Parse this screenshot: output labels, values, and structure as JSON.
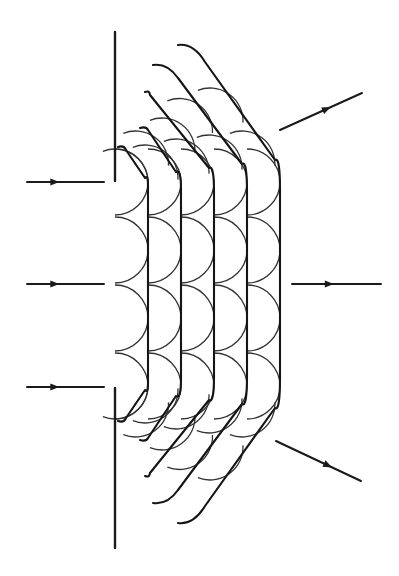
{
  "figure": {
    "title": "Huygens wavelet construction of diffraction through an aperture",
    "colors": {
      "background": "#ffffff",
      "ink": "#1a1a1a"
    }
  },
  "barrier": {
    "x": 115,
    "segments": [
      {
        "name": "upper-barrier",
        "y1": 32,
        "y2": 181
      },
      {
        "name": "lower-barrier",
        "y1": 388,
        "y2": 548
      }
    ]
  },
  "incident_rays": [
    {
      "x1": 27,
      "y1": 182,
      "x2": 104,
      "y2": 182,
      "head_at": 0.42
    },
    {
      "x1": 27,
      "y1": 284,
      "x2": 104,
      "y2": 284,
      "head_at": 0.42
    },
    {
      "x1": 27,
      "y1": 387,
      "x2": 104,
      "y2": 387,
      "head_at": 0.42
    }
  ],
  "outgoing_rays": [
    {
      "x1": 280,
      "y1": 130,
      "x2": 362,
      "y2": 93,
      "head_at": 0.62
    },
    {
      "x1": 292,
      "y1": 284,
      "x2": 381,
      "y2": 284,
      "head_at": 0.47
    },
    {
      "x1": 276,
      "y1": 441,
      "x2": 361,
      "y2": 481,
      "head_at": 0.66
    }
  ],
  "symmetry_axis_y": 284,
  "wavelength": 33,
  "wavelet_sources_y": [
    182,
    250,
    318,
    386
  ],
  "wavefronts": [
    {
      "index": 1,
      "x": 148,
      "vertical_top": 186,
      "corner": [
        145,
        178
      ],
      "diag_end": [
        126,
        150
      ],
      "tip": [
        118,
        147
      ]
    },
    {
      "index": 2,
      "x": 181,
      "vertical_top": 190,
      "corner": [
        176,
        172
      ],
      "diag_end": [
        148,
        130
      ],
      "tip": [
        140,
        128
      ]
    },
    {
      "index": 3,
      "x": 214,
      "vertical_top": 192,
      "corner": [
        209,
        168
      ],
      "diag_end": [
        150,
        95
      ],
      "tip": [
        145,
        92
      ]
    },
    {
      "index": 4,
      "x": 247,
      "vertical_top": 192,
      "corner": [
        242,
        164
      ],
      "diag_end": [
        178,
        78
      ],
      "tip": [
        153,
        65
      ]
    },
    {
      "index": 5,
      "x": 280,
      "vertical_top": 190,
      "corner": [
        275,
        160
      ],
      "diag_end": [
        205,
        62
      ],
      "tip": [
        178,
        45
      ]
    }
  ]
}
